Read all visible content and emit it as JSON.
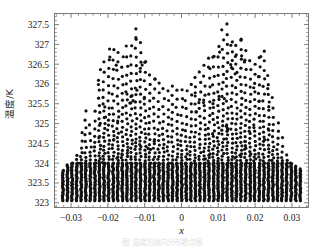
{
  "figure": {
    "caption": "图 温度沿轴向分布散点图",
    "background_color": "#ffffff",
    "frame_color": "#6e6e6e",
    "point_color": "#111111"
  },
  "axes": {
    "y_axis_label": "温度/K",
    "x_axis_label": "x",
    "x_ticks": [
      "-0.03",
      "-0.02",
      "-0.01",
      "0",
      "0.01",
      "0.02",
      "0.03"
    ],
    "x_tick_values": [
      -0.03,
      -0.02,
      -0.01,
      0,
      0.01,
      0.02,
      0.03
    ],
    "y_ticks": [
      "323",
      "323.5",
      "324",
      "324.5",
      "325",
      "325.5",
      "326",
      "326.5",
      "327",
      "327.5"
    ],
    "y_tick_values": [
      323,
      323.5,
      324,
      324.5,
      325,
      325.5,
      326,
      326.5,
      327,
      327.5
    ],
    "x_minor_per_major": 5,
    "y_minor_per_major": 5
  },
  "chart_data": {
    "type": "scatter",
    "title": "",
    "xlabel": "x",
    "ylabel": "温度/K",
    "xlim": [
      -0.0345,
      0.0345
    ],
    "ylim": [
      322.88,
      327.78
    ],
    "grid": false,
    "legend": null,
    "marker": "circle",
    "marker_size": 1.6,
    "marker_color": "#111111",
    "columns_x_start": -0.0322,
    "columns_x_end": 0.0322,
    "column_spacing": 0.00124,
    "floor_value": 323.05,
    "envelope": {
      "note": "Upper limit of points as a function of x, read off the plot.",
      "x": [
        -0.0322,
        -0.03,
        -0.028,
        -0.026,
        -0.024,
        -0.022,
        -0.02,
        -0.018,
        -0.016,
        -0.014,
        -0.012,
        -0.01,
        -0.008,
        -0.006,
        -0.004,
        -0.002,
        0.0,
        0.002,
        0.004,
        0.006,
        0.008,
        0.01,
        0.012,
        0.014,
        0.016,
        0.018,
        0.02,
        0.022,
        0.024,
        0.026,
        0.028,
        0.03,
        0.0322
      ],
      "y": [
        323.85,
        324.05,
        324.55,
        325.35,
        325.1,
        326.6,
        327.05,
        327.2,
        326.6,
        327.2,
        327.62,
        326.7,
        326.4,
        326.15,
        326.05,
        326.0,
        325.95,
        326.05,
        326.2,
        326.45,
        326.75,
        327.15,
        327.55,
        327.25,
        327.2,
        326.9,
        326.6,
        327.05,
        326.1,
        325.1,
        324.5,
        324.05,
        323.9
      ]
    },
    "lower_dense_band": {
      "note": "Below this value every column is essentially saturated with points.",
      "value": 324.0
    },
    "approx_point_count": 4200
  }
}
